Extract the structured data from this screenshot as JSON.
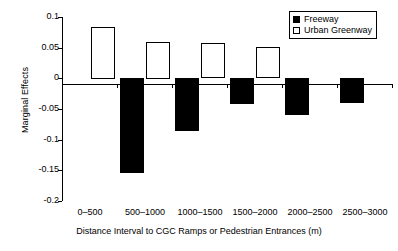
{
  "chart_data": {
    "type": "bar",
    "title": "",
    "xlabel": "Distance Interval to CGC Ramps or Pedestrian Entrances (m)",
    "ylabel": "Marginal Effects",
    "categories": [
      "0–500",
      "500–1000",
      "1000–1500",
      "1500–2000",
      "2000–2500",
      "2500–3000"
    ],
    "series": [
      {
        "name": "Freeway",
        "color": "#000000",
        "style": "filled",
        "values": [
          null,
          -0.155,
          -0.087,
          -0.042,
          -0.06,
          -0.04
        ]
      },
      {
        "name": "Urban Greenway",
        "color": "#ffffff",
        "style": "hollow",
        "values": [
          0.084,
          0.06,
          0.057,
          0.051,
          null,
          null
        ]
      }
    ],
    "ylim": [
      -0.2,
      0.1
    ],
    "ytick_labels": [
      "0.1",
      "0.05",
      "0",
      "-0.05",
      "-0.1",
      "-0.15",
      "-0.2"
    ],
    "ytick_values": [
      0.1,
      0.05,
      0,
      -0.05,
      -0.1,
      -0.15,
      -0.2
    ],
    "grid": false,
    "legend_position": "top-right",
    "legend_entries": [
      "Freeway",
      "Urban Greenway"
    ]
  },
  "legend": {
    "items": [
      {
        "label": "Freeway",
        "swatch": "filled-square-icon"
      },
      {
        "label": "Urban Greenway",
        "swatch": "hollow-square-icon"
      }
    ]
  },
  "axes": {
    "y_title": "Marginal Effects",
    "x_title": "Distance Interval to CGC Ramps or Pedestrian Entrances (m)",
    "y_ticks": [
      "0.1",
      "0.05",
      "0",
      "-0.05",
      "-0.1",
      "-0.15",
      "-0.2"
    ],
    "x_ticks": [
      "0–500",
      "500–1000",
      "1000–1500",
      "1500–2000",
      "2000–2500",
      "2500–3000"
    ]
  }
}
